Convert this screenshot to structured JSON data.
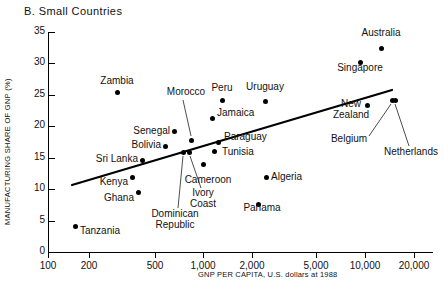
{
  "panel": {
    "title": "B. Small Countries"
  },
  "chart_data": {
    "type": "scatter",
    "title": "B. Small Countries",
    "xlabel": "GNP PER CAPITA, U.S. dollars at 1988",
    "ylabel": "MANUFACTURING SHARE OF GNP (%)",
    "xscale": "log",
    "xlim": [
      100,
      20000
    ],
    "ylim": [
      0,
      35
    ],
    "grid": false,
    "legend": "none",
    "xticks": [
      {
        "value": 100,
        "label": "100",
        "px": 48
      },
      {
        "value": 200,
        "label": "200",
        "px": 89
      },
      {
        "value": 500,
        "label": "500",
        "px": 155
      },
      {
        "value": 1000,
        "label": "1,000",
        "px": 203
      },
      {
        "value": 2000,
        "label": "2,000",
        "px": 252
      },
      {
        "value": 5000,
        "label": "5,000",
        "px": 316
      },
      {
        "value": 10000,
        "label": "10,000",
        "px": 365
      },
      {
        "value": 20000,
        "label": "20,000",
        "px": 414
      }
    ],
    "yticks": [
      {
        "value": 0,
        "label": "0"
      },
      {
        "value": 5,
        "label": "5"
      },
      {
        "value": 10,
        "label": "10"
      },
      {
        "value": 15,
        "label": "15"
      },
      {
        "value": 20,
        "label": "20"
      },
      {
        "value": 25,
        "label": "25"
      },
      {
        "value": 30,
        "label": "30"
      },
      {
        "value": 35,
        "label": "35"
      }
    ],
    "points": [
      {
        "name": "Tanzania",
        "x": 170,
        "y": 4.2,
        "px": 75,
        "py": 226,
        "label_x": 80,
        "label_y": 231,
        "align": "left"
      },
      {
        "name": "Zambia",
        "x": 290,
        "y": 25.2,
        "px": 117,
        "py": 92,
        "label_x": 117,
        "label_y": 81,
        "align": "center"
      },
      {
        "name": "Kenya",
        "x": 380,
        "y": 11.9,
        "px": 132,
        "py": 177,
        "label_x": 128,
        "label_y": 182,
        "align": "right"
      },
      {
        "name": "Ghana",
        "x": 430,
        "y": 10.2,
        "px": 138,
        "py": 192,
        "label_x": 134,
        "label_y": 198,
        "align": "right"
      },
      {
        "name": "Sri Lanka",
        "x": 450,
        "y": 15.1,
        "px": 142,
        "py": 160,
        "label_x": 138,
        "label_y": 159,
        "align": "right"
      },
      {
        "name": "Bolivia",
        "x": 620,
        "y": 16.8,
        "px": 165,
        "py": 146,
        "label_x": 161,
        "label_y": 145,
        "align": "right"
      },
      {
        "name": "Senegal",
        "x": 700,
        "y": 19.5,
        "px": 174,
        "py": 131,
        "label_x": 170,
        "label_y": 131,
        "align": "right"
      },
      {
        "name": "Morocco",
        "x": 820,
        "y": 18.0,
        "px": 191,
        "py": 140,
        "label_x": 186,
        "label_y": 92,
        "align": "center",
        "leader": [
          191,
          136,
          183,
          100
        ]
      },
      {
        "name": "Dominican Republic",
        "x": 760,
        "y": 16.0,
        "px": 183,
        "py": 152,
        "label_x": 175,
        "label_y": 214,
        "align": "center",
        "leader": [
          183,
          156,
          178,
          208
        ]
      },
      {
        "name": "Ivory Coast",
        "x": 790,
        "y": 16.0,
        "px": 189,
        "py": 152,
        "label_x": 203,
        "label_y": 193,
        "align": "center",
        "leader": [
          190,
          156,
          201,
          188
        ]
      },
      {
        "name": "Cameroon",
        "x": 1010,
        "y": 13.0,
        "px": 203,
        "py": 164,
        "label_x": 208,
        "label_y": 180,
        "align": "center"
      },
      {
        "name": "Jamaica",
        "x": 1120,
        "y": 21.3,
        "px": 212,
        "py": 118,
        "label_x": 217,
        "label_y": 113,
        "align": "left"
      },
      {
        "name": "Paraguay",
        "x": 1200,
        "y": 17.5,
        "px": 218,
        "py": 142,
        "label_x": 224,
        "label_y": 137,
        "align": "left"
      },
      {
        "name": "Tunisia",
        "x": 1150,
        "y": 16.2,
        "px": 214,
        "py": 151,
        "label_x": 222,
        "label_y": 152,
        "align": "left"
      },
      {
        "name": "Peru",
        "x": 1320,
        "y": 24.1,
        "px": 222,
        "py": 100,
        "label_x": 222,
        "label_y": 88,
        "align": "center"
      },
      {
        "name": "Uruguay",
        "x": 2400,
        "y": 24.0,
        "px": 265,
        "py": 101,
        "label_x": 265,
        "label_y": 87,
        "align": "center"
      },
      {
        "name": "Algeria",
        "x": 2450,
        "y": 11.9,
        "px": 266,
        "py": 177,
        "label_x": 271,
        "label_y": 177,
        "align": "left"
      },
      {
        "name": "Panama",
        "x": 2200,
        "y": 7.6,
        "px": 258,
        "py": 204,
        "label_x": 262,
        "label_y": 208,
        "align": "center"
      },
      {
        "name": "Singapore",
        "x": 9000,
        "y": 30.2,
        "px": 360,
        "py": 62,
        "label_x": 360,
        "label_y": 68,
        "align": "center"
      },
      {
        "name": "Australia",
        "x": 13000,
        "y": 32.4,
        "px": 381,
        "py": 48,
        "label_x": 381,
        "label_y": 33,
        "align": "center"
      },
      {
        "name": "New Zealand",
        "x": 11000,
        "y": 23.4,
        "px": 367,
        "py": 105,
        "label_x": 351,
        "label_y": 104,
        "align": "center"
      },
      {
        "name": "Belgium",
        "x": 15000,
        "y": 24.2,
        "px": 392,
        "py": 100,
        "label_x": 349,
        "label_y": 139,
        "align": "center",
        "leader": [
          391,
          104,
          369,
          136
        ]
      },
      {
        "name": "Netherlands",
        "x": 15500,
        "y": 24.2,
        "px": 395,
        "py": 100,
        "label_x": 411,
        "label_y": 152,
        "align": "center",
        "leader": [
          395,
          104,
          409,
          146
        ]
      }
    ],
    "trendline": {
      "x1": 72,
      "y1": 185,
      "x2": 392,
      "y2": 90,
      "description": "upward sloping regression line"
    }
  }
}
